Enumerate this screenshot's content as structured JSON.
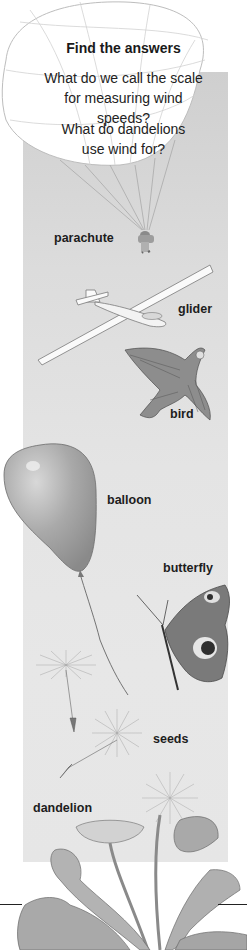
{
  "box": {
    "heading": "Find the answers",
    "questions": [
      "What do we call the scale for measuring wind speeds?",
      "What do dandelions use wind for?"
    ]
  },
  "labels": {
    "parachute": "parachute",
    "glider": "glider",
    "bird": "bird",
    "balloon": "balloon",
    "butterfly": "butterfly",
    "seeds": "seeds",
    "dandelion": "dandelion"
  },
  "colors": {
    "panel": "#dedede",
    "text": "#1a1a1a"
  }
}
